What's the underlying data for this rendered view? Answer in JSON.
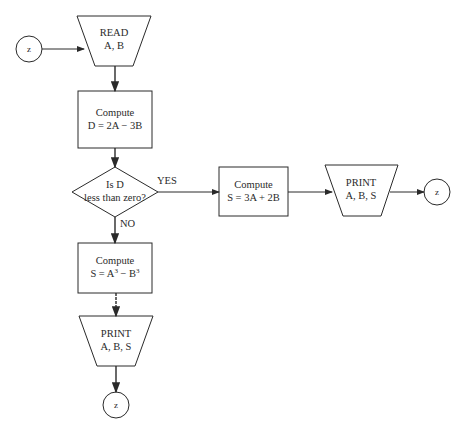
{
  "diagram": {
    "type": "flowchart",
    "connector_label": "z",
    "nodes": {
      "start_connector": {
        "label": "z"
      },
      "read": {
        "line1": "READ",
        "line2": "A, B"
      },
      "compute_d": {
        "line1": "Compute",
        "line2": "D = 2A − 3B"
      },
      "decision": {
        "line1": "Is D",
        "line2": "less than zero?",
        "yes": "YES",
        "no": "NO"
      },
      "compute_s_yes": {
        "line1": "Compute",
        "line2": "S = 3A + 2B"
      },
      "print_yes": {
        "line1": "PRINT",
        "line2": "A, B, S"
      },
      "end_connector_yes": {
        "label": "z"
      },
      "compute_s_no": {
        "line1": "Compute",
        "line2_base1": "S = A",
        "line2_exp1": "3",
        "line2_mid": " − B",
        "line2_exp2": "3"
      },
      "print_no": {
        "line1": "PRINT",
        "line2": "A, B, S"
      },
      "end_connector_no": {
        "label": "z"
      }
    },
    "colors": {
      "stroke": "#2a2a2a",
      "background": "#ffffff"
    }
  }
}
